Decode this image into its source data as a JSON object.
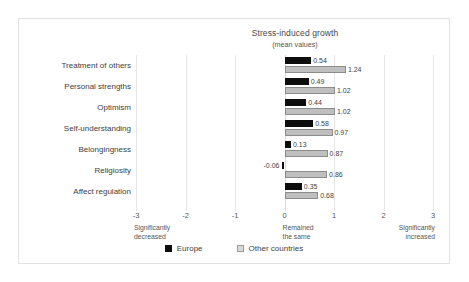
{
  "chart_data": {
    "type": "bar",
    "orientation": "horizontal",
    "title": "Stress-induced growth",
    "subtitle": "(mean values)",
    "xlabel": "",
    "ylabel": "",
    "xlim": [
      -3,
      3
    ],
    "xticks": [
      "-3",
      "-2",
      "-1",
      "0",
      "1",
      "2",
      "3"
    ],
    "xtick_values": [
      -3,
      -2,
      -1,
      0,
      1,
      2,
      3
    ],
    "grid": true,
    "legend_position": "bottom",
    "categories": [
      "Treatment of others",
      "Personal strengths",
      "Optimism",
      "Self-understanding",
      "Belongingness",
      "Religiosity",
      "Affect regulation"
    ],
    "series": [
      {
        "name": "Europe",
        "color": "#0d0d0d",
        "values": [
          0.54,
          0.49,
          0.44,
          0.58,
          0.13,
          -0.06,
          0.35
        ],
        "labels": [
          "0.54",
          "0.49",
          "0.44",
          "0.58",
          "0.13",
          "-0.06",
          "0.35"
        ]
      },
      {
        "name": "Other countries",
        "color": "#bfbfbf",
        "values": [
          1.24,
          1.02,
          1.02,
          0.97,
          0.87,
          0.86,
          0.68
        ],
        "labels": [
          "1.24",
          "1.02",
          "1.02",
          "0.97",
          "0.87",
          "0.86",
          "0.68"
        ]
      }
    ],
    "axis_annotations": [
      {
        "at": -3,
        "text": "Significantly decreased",
        "lines": [
          "Significantly",
          "decreased"
        ],
        "align": "left"
      },
      {
        "at": 0,
        "text": "Remained the same",
        "lines": [
          "Remained",
          "the same"
        ],
        "align": "left"
      },
      {
        "at": 3,
        "text": "Significantly increased",
        "lines": [
          "Significantly",
          "increased"
        ],
        "align": "right"
      }
    ]
  },
  "legend": {
    "items": [
      {
        "label": "Europe",
        "swatch": "black-square"
      },
      {
        "label": "Other countries",
        "swatch": "light-gray-square"
      }
    ]
  },
  "colors": {
    "europe": "#0d0d0d",
    "other_countries": "#bfbfbf",
    "gridline": "#e6e6e6",
    "text": "#404040",
    "frame": "#e2e2e2",
    "background": "#ffffff"
  }
}
